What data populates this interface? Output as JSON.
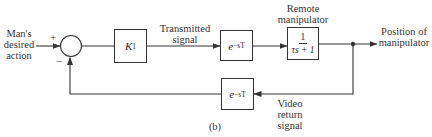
{
  "diagram": {
    "type": "feedback control block diagram",
    "caption": "(b)",
    "input": {
      "label_lines": [
        "Man's",
        "desired",
        "action"
      ]
    },
    "summing_junction": {
      "plus_sign": "+",
      "minus_sign": "−"
    },
    "blocks": {
      "gain": {
        "symbol": "K",
        "subscript": "1"
      },
      "forward_delay": {
        "base": "e",
        "exponent": "−sT"
      },
      "manipulator": {
        "numerator": "1",
        "denominator": "τs + 1"
      },
      "feedback_delay": {
        "base": "e",
        "exponent": "−sT"
      }
    },
    "signals": {
      "transmitted": {
        "label_lines": [
          "Transmitted",
          "signal"
        ]
      },
      "remote": {
        "label_lines": [
          "Remote",
          "manipulator"
        ]
      },
      "output": {
        "label_lines": [
          "Position of",
          "manipulator"
        ]
      },
      "video_return": {
        "label_lines": [
          "Video",
          "return",
          "signal"
        ]
      }
    },
    "colors": {
      "line": "#333333",
      "background": "#ffffff"
    }
  }
}
